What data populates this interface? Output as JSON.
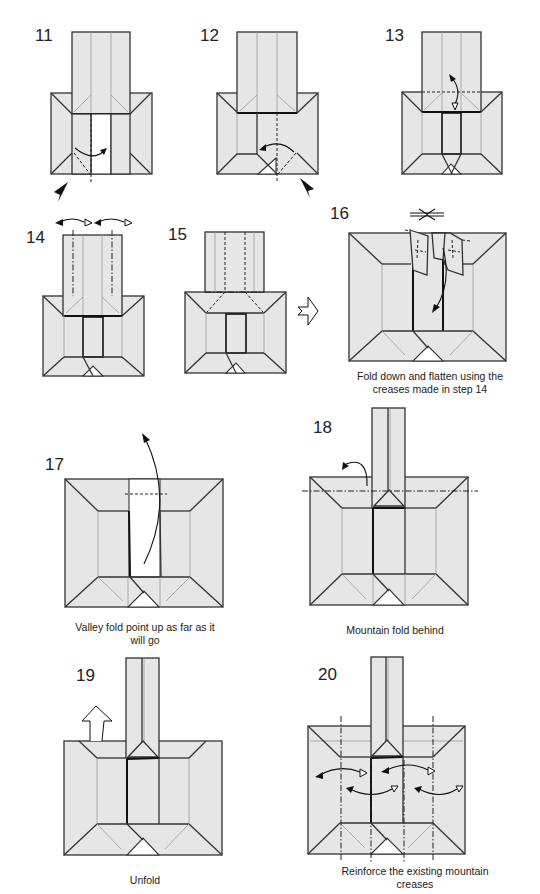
{
  "page": {
    "background": "#ffffff",
    "paper_color": "#e6e6e6"
  },
  "steps": [
    {
      "number": "11",
      "caption": ""
    },
    {
      "number": "12",
      "caption": ""
    },
    {
      "number": "13",
      "caption": ""
    },
    {
      "number": "14",
      "caption": ""
    },
    {
      "number": "15",
      "caption": "Form a 3D ‘tube’"
    },
    {
      "number": "16",
      "caption_line1": "Fold down and flatten using the",
      "caption_line2": "creases made in step 14"
    },
    {
      "number": "17",
      "caption_line1": "Valley fold point up as far as it",
      "caption_line2": "will go"
    },
    {
      "number": "18",
      "caption": "Mountain fold behind"
    },
    {
      "number": "19",
      "caption": "Unfold"
    },
    {
      "number": "20",
      "caption_line1": "Reinforce the existing mountain",
      "caption_line2": "creases"
    }
  ],
  "symbols": {
    "valley_fold": "dashed-line",
    "mountain_fold": "dash-dot-line",
    "fold_arrow": "curved-arrow",
    "push_arrow": "black-arrowhead",
    "turn_over": "hollow-arrow",
    "unfold": "hollow-up-arrow"
  }
}
